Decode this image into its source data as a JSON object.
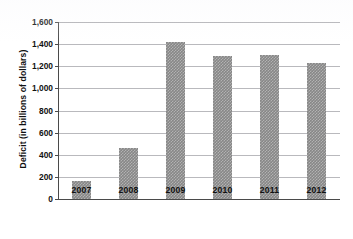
{
  "chart_data": {
    "type": "bar",
    "title": "",
    "xlabel": "",
    "ylabel": "Deficit (in billions of dollars)",
    "categories": [
      "2007",
      "2008",
      "2009",
      "2010",
      "2011",
      "2012"
    ],
    "values": [
      160,
      460,
      1415,
      1295,
      1305,
      1230
    ],
    "series": [
      {
        "name": "Deficit",
        "values": [
          160,
          460,
          1415,
          1295,
          1305,
          1230
        ]
      }
    ],
    "ylim": [
      0,
      1600
    ],
    "ytick_values": [
      0,
      200,
      400,
      600,
      800,
      1000,
      1200,
      1400,
      1600
    ],
    "ytick_labels": [
      "0",
      "200",
      "400",
      "600",
      "800",
      "1,000",
      "1,200",
      "1,400",
      "1,600"
    ],
    "grid": true,
    "legend": false,
    "legend_position": "none",
    "bar_color": "#878787",
    "gridline_color": "#b9b9bd",
    "axis_color": "#4a4a4a",
    "background_color": "#ffffff"
  }
}
